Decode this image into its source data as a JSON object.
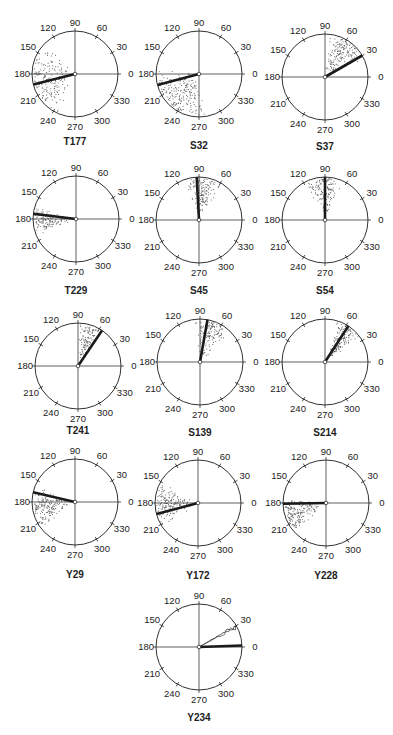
{
  "figure": {
    "width": 393,
    "height": 735,
    "radius": 43,
    "colors": {
      "ink": "#1a1a1a",
      "dots": "#555555",
      "axis": "#222222",
      "background": "#ffffff"
    },
    "tick_angles": [
      0,
      30,
      60,
      90,
      120,
      150,
      180,
      210,
      240,
      270,
      300,
      330
    ],
    "tick_labels": [
      "0",
      "30",
      "60",
      "90",
      "120",
      "150",
      "180",
      "210",
      "240",
      "270",
      "300",
      "330"
    ]
  },
  "chart_data": {
    "type": "polar-scatter",
    "angular_axis": {
      "unit": "degrees",
      "ticks": [
        0,
        30,
        60,
        90,
        120,
        150,
        180,
        210,
        240,
        270,
        300,
        330
      ],
      "zero": "right (east)",
      "direction": "counterclockwise"
    },
    "panels": [
      {
        "label": "T177",
        "cx": 75,
        "cy": 74,
        "label_y": 145,
        "mean_angle": 194,
        "spread_from": 130,
        "spread_to": 250,
        "density": 170
      },
      {
        "label": "S32",
        "cx": 199,
        "cy": 74,
        "label_y": 149,
        "mean_angle": 195,
        "spread_from": 170,
        "spread_to": 280,
        "density": 200
      },
      {
        "label": "S37",
        "cx": 325,
        "cy": 77,
        "label_y": 150,
        "mean_angle": 30,
        "spread_from": 25,
        "spread_to": 90,
        "density": 160
      },
      {
        "label": "T229",
        "cx": 76,
        "cy": 219,
        "label_y": 294,
        "mean_angle": 173,
        "spread_from": 160,
        "spread_to": 205,
        "density": 130
      },
      {
        "label": "S45",
        "cx": 199,
        "cy": 220,
        "label_y": 294,
        "mean_angle": 93,
        "spread_from": 55,
        "spread_to": 115,
        "density": 150
      },
      {
        "label": "S54",
        "cx": 325,
        "cy": 220,
        "label_y": 294,
        "mean_angle": 90,
        "spread_from": 65,
        "spread_to": 120,
        "density": 160
      },
      {
        "label": "T241",
        "cx": 78,
        "cy": 366,
        "label_y": 434,
        "mean_angle": 56,
        "spread_from": 55,
        "spread_to": 90,
        "density": 110
      },
      {
        "label": "S139",
        "cx": 200,
        "cy": 362,
        "label_y": 436,
        "mean_angle": 80,
        "spread_from": 45,
        "spread_to": 100,
        "density": 140
      },
      {
        "label": "S214",
        "cx": 325,
        "cy": 362,
        "label_y": 436,
        "mean_angle": 57,
        "spread_from": 35,
        "spread_to": 75,
        "density": 150
      },
      {
        "label": "Y29",
        "cx": 75,
        "cy": 502,
        "label_y": 578,
        "mean_angle": 167,
        "spread_from": 155,
        "spread_to": 220,
        "density": 170
      },
      {
        "label": "Y172",
        "cx": 198,
        "cy": 503,
        "label_y": 579,
        "mean_angle": 195,
        "spread_from": 150,
        "spread_to": 215,
        "density": 170
      },
      {
        "label": "Y228",
        "cx": 326,
        "cy": 503,
        "label_y": 579,
        "mean_angle": 181,
        "spread_from": 170,
        "spread_to": 225,
        "density": 180
      },
      {
        "label": "Y234",
        "cx": 199,
        "cy": 647,
        "label_y": 721,
        "mean_angle": 2,
        "secondary_angle": 30,
        "spread_from": 0,
        "spread_to": 0,
        "density": 0
      }
    ]
  }
}
